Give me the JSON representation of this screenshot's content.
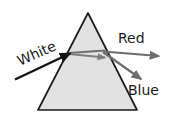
{
  "diagram": {
    "background_color": "#ffffff",
    "prism": {
      "name": "triangular-prism",
      "fill_color": "#e2e2e2",
      "stroke_color": "#1a1a1a",
      "apex": {
        "x": 88,
        "y": 13
      },
      "bottom_left": {
        "x": 38,
        "y": 110
      },
      "bottom_right": {
        "x": 137,
        "y": 110
      }
    },
    "rays": [
      {
        "name": "white-incident-ray",
        "label": "White",
        "color": "#111111",
        "start": {
          "x": 15,
          "y": 79
        },
        "end": {
          "x": 69,
          "y": 53
        },
        "arrow": true
      },
      {
        "name": "red-refracted-ray",
        "label": "Red",
        "color": "#6e6e6e",
        "start": {
          "x": 103,
          "y": 52
        },
        "end": {
          "x": 158,
          "y": 56
        },
        "arrow": true
      },
      {
        "name": "blue-refracted-ray",
        "label": "Blue",
        "color": "#6e6e6e",
        "start": {
          "x": 103,
          "y": 52
        },
        "end": {
          "x": 140,
          "y": 78
        },
        "arrow": true
      }
    ],
    "internal_rays": [
      {
        "name": "internal-ray-upper",
        "color": "#6e6e6e",
        "start": {
          "x": 69,
          "y": 53
        },
        "end": {
          "x": 104,
          "y": 51
        }
      },
      {
        "name": "internal-ray-lower",
        "color": "#7a7a7a",
        "start": {
          "x": 69,
          "y": 54
        },
        "end": {
          "x": 104,
          "y": 57
        }
      }
    ],
    "labels": {
      "white": "White",
      "red": "Red",
      "blue": "Blue"
    },
    "label_positions": {
      "white": {
        "x": 20,
        "y": 66,
        "rotation": -24
      },
      "red": {
        "x": 118,
        "y": 43,
        "rotation": 0
      },
      "blue": {
        "x": 128,
        "y": 95,
        "rotation": 0
      }
    }
  }
}
